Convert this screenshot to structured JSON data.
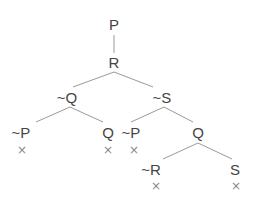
{
  "diagram": {
    "type": "truth-tree",
    "colors": {
      "text": "#444444",
      "edge": "#9a9a9a",
      "closed_mark": "#888888"
    },
    "closed_symbol": "×",
    "nodes": [
      {
        "id": "n1",
        "label": "P",
        "x": 114,
        "y": 30
      },
      {
        "id": "n2",
        "label": "R",
        "x": 114,
        "y": 68
      },
      {
        "id": "n3",
        "label": "~Q",
        "x": 67,
        "y": 103
      },
      {
        "id": "n4",
        "label": "~S",
        "x": 162,
        "y": 103
      },
      {
        "id": "n5",
        "label": "~P",
        "x": 21,
        "y": 138
      },
      {
        "id": "n6",
        "label": "Q",
        "x": 108,
        "y": 138
      },
      {
        "id": "n7",
        "label": "~P",
        "x": 131,
        "y": 138
      },
      {
        "id": "n8",
        "label": "Q",
        "x": 198,
        "y": 138
      },
      {
        "id": "n9",
        "label": "~R",
        "x": 151,
        "y": 175
      },
      {
        "id": "n10",
        "label": "S",
        "x": 235,
        "y": 175
      }
    ],
    "edges": [
      {
        "x1": 114,
        "y1": 35,
        "x2": 114,
        "y2": 53
      },
      {
        "x1": 114,
        "y1": 72,
        "x2": 73,
        "y2": 87
      },
      {
        "x1": 114,
        "y1": 72,
        "x2": 153,
        "y2": 87
      },
      {
        "x1": 70,
        "y1": 107,
        "x2": 36,
        "y2": 122
      },
      {
        "x1": 70,
        "y1": 107,
        "x2": 103,
        "y2": 122
      },
      {
        "x1": 164,
        "y1": 107,
        "x2": 131,
        "y2": 122
      },
      {
        "x1": 164,
        "y1": 107,
        "x2": 193,
        "y2": 122
      },
      {
        "x1": 198,
        "y1": 143,
        "x2": 163,
        "y2": 159
      },
      {
        "x1": 198,
        "y1": 143,
        "x2": 232,
        "y2": 159
      }
    ],
    "closed_marks": [
      {
        "branch": "n5",
        "x": 22,
        "y": 154
      },
      {
        "branch": "n6",
        "x": 108,
        "y": 154
      },
      {
        "branch": "n7",
        "x": 134,
        "y": 154
      },
      {
        "branch": "n9",
        "x": 156,
        "y": 190
      },
      {
        "branch": "n10",
        "x": 236,
        "y": 190
      }
    ]
  }
}
